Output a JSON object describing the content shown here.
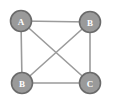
{
  "figure": {
    "background_color": "#ffffff",
    "width": 114,
    "height": 104
  },
  "style": {
    "node_fill": "#9a9a9a",
    "node_stroke": "#6b6b6b",
    "node_radius": 10.5,
    "node_stroke_width": 1.6,
    "label_color": "#ffffff",
    "edge_color": "#9b9b9b",
    "edge_width": 1.6
  },
  "chart_data": {
    "type": "diagram",
    "diagram_kind": "node-link-graph",
    "directed": false,
    "title": "",
    "nodes": [
      {
        "id": "n1",
        "label": "A",
        "x": 21,
        "y": 21
      },
      {
        "id": "n2",
        "label": "B",
        "x": 90,
        "y": 22
      },
      {
        "id": "n3",
        "label": "B",
        "x": 22,
        "y": 83
      },
      {
        "id": "n4",
        "label": "C",
        "x": 90,
        "y": 83
      }
    ],
    "edges": [
      {
        "source": "n1",
        "target": "n2",
        "kind": "top"
      },
      {
        "source": "n3",
        "target": "n4",
        "kind": "bottom"
      },
      {
        "source": "n1",
        "target": "n3",
        "kind": "left"
      },
      {
        "source": "n2",
        "target": "n4",
        "kind": "right"
      },
      {
        "source": "n1",
        "target": "n4",
        "kind": "diagonal"
      },
      {
        "source": "n2",
        "target": "n3",
        "kind": "diagonal"
      }
    ],
    "node_count": 4,
    "edge_count": 6,
    "legend": [],
    "annotations": []
  }
}
